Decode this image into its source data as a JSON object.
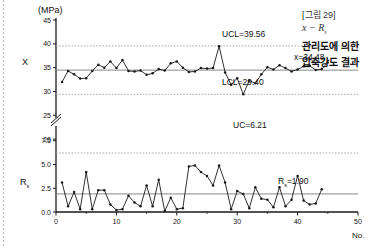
{
  "figure": {
    "unit_label": "(MPa)",
    "x_axis_name": "No."
  },
  "caption": {
    "figure_number": "[그림 29]",
    "symbol": "x − R",
    "symbol_sub": "s",
    "line1": "관리도에 의한",
    "line2": "압축강도 결과"
  },
  "colors": {
    "line": "#1a1a1a",
    "marker": "#1a1a1a",
    "center_line": "#888888",
    "control_limit": "#9a9a9a",
    "axis": "#1a1a1a"
  },
  "chart_data": [
    {
      "type": "line",
      "title": "",
      "name": "x-chart",
      "ylabel": "X",
      "xlabel": "No.",
      "unit": "(MPa)",
      "ylim": [
        28.0,
        45.0
      ],
      "xlim": [
        0,
        50
      ],
      "yticks": [
        45,
        40,
        35,
        30,
        25,
        20,
        7.5
      ],
      "yticks_drawn": [
        45,
        40,
        35,
        30,
        25,
        20
      ],
      "axis_break": true,
      "xticks": [
        0,
        10,
        20,
        30,
        40,
        50
      ],
      "grid": false,
      "legend": "none",
      "annotations": [
        {
          "label": "UCL=39.56",
          "value": 39.56,
          "style": "dotted"
        },
        {
          "label": "x=34.48",
          "value": 34.48,
          "style": "solid"
        },
        {
          "label": "LCL=29.40",
          "value": 29.4,
          "style": "dotted"
        }
      ],
      "x": [
        1,
        2,
        3,
        4,
        5,
        6,
        7,
        8,
        9,
        10,
        11,
        12,
        13,
        14,
        15,
        16,
        17,
        18,
        19,
        20,
        21,
        22,
        23,
        24,
        25,
        26,
        27,
        28,
        29,
        30,
        31,
        32,
        33,
        34,
        35,
        36,
        37,
        38,
        39,
        40,
        41,
        42,
        43,
        44,
        45
      ],
      "values": [
        32.0,
        34.3,
        33.6,
        32.7,
        32.8,
        34.3,
        35.6,
        35.0,
        36.3,
        34.9,
        36.6,
        34.3,
        34.2,
        34.4,
        33.5,
        33.8,
        34.7,
        34.4,
        35.9,
        36.3,
        35.0,
        34.1,
        34.2,
        34.9,
        34.8,
        34.9,
        39.5,
        34.0,
        31.4,
        32.8,
        29.4,
        32.3,
        31.7,
        33.6,
        35.1,
        34.6,
        35.5,
        34.9,
        34.2,
        34.6,
        35.3,
        35.4,
        34.5,
        34.7,
        36.1
      ]
    },
    {
      "type": "line",
      "title": "",
      "name": "Rs-chart",
      "ylabel": "Rs",
      "xlabel": "No.",
      "ylim": [
        0.0,
        8.0
      ],
      "xlim": [
        0,
        50
      ],
      "yticks": [
        0.0,
        2.5,
        5.0,
        7.5
      ],
      "ytick_labels": [
        "0.0",
        "2.5",
        "5.0",
        "7.5"
      ],
      "xticks": [
        0,
        10,
        20,
        30,
        40,
        50
      ],
      "grid": false,
      "legend": "none",
      "annotations": [
        {
          "label": "UC=6.21",
          "value": 6.21,
          "style": "dotted"
        },
        {
          "label": "Rs=1.90",
          "value": 1.9,
          "style": "solid"
        }
      ],
      "x": [
        1,
        2,
        3,
        4,
        5,
        6,
        7,
        8,
        9,
        10,
        11,
        12,
        13,
        14,
        15,
        16,
        17,
        18,
        19,
        20,
        21,
        22,
        23,
        24,
        25,
        26,
        27,
        28,
        29,
        30,
        31,
        32,
        33,
        34,
        35,
        36,
        37,
        38,
        39,
        40,
        41,
        42,
        43,
        44
      ],
      "values": [
        3.1,
        0.6,
        2.1,
        0.3,
        4.2,
        0.3,
        2.3,
        2.3,
        0.8,
        0.2,
        0.3,
        1.7,
        1.0,
        0.6,
        2.8,
        0.6,
        3.4,
        0.1,
        1.5,
        0.3,
        0.4,
        4.8,
        4.9,
        4.2,
        3.8,
        2.8,
        4.9,
        3.1,
        0.3,
        2.2,
        1.9,
        0.4,
        2.6,
        1.4,
        1.3,
        0.5,
        2.6,
        0.6,
        1.3,
        3.8,
        1.2,
        0.8,
        0.9,
        2.4
      ]
    }
  ],
  "labels": {
    "x_chart_axis_name": "X",
    "rs_chart_axis_name": "R",
    "rs_chart_axis_sub": "s",
    "ucl_x": "UCL=39.56",
    "center_x": "x=34.48",
    "lcl_x": "LCL=29.40",
    "uc_rs": "UC=6.21",
    "center_rs_prefix": "R",
    "center_rs_sub": "s",
    "center_rs_value": "=1.90"
  }
}
